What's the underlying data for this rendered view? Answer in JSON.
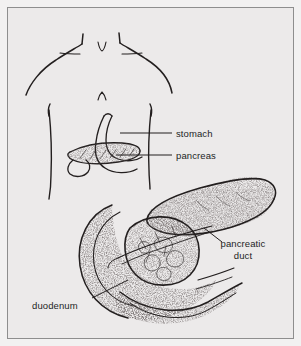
{
  "figure": {
    "kind": "anatomical-line-drawing",
    "style": "black ink line art with stippled shading",
    "background_color": "#eceaea",
    "border_color": "#8e8e8e",
    "ink_color": "#231f1f"
  },
  "labels": {
    "stomach": "stomach",
    "pancreas": "pancreas",
    "pancreatic_duct": "pancreatic duct",
    "duodenum": "duodenum"
  },
  "views": {
    "torso_inset": {
      "description": "upper body outline showing stomach and pancreas in situ",
      "parts": [
        "shoulders",
        "neck notch",
        "clavicles",
        "torso flanks",
        "stomach",
        "pancreas"
      ]
    },
    "detail_view": {
      "description": "enlarged pancreas with duodenal C-loop and pancreatic duct",
      "parts": [
        "pancreas tail",
        "pancreas body",
        "pancreas head",
        "duodenum",
        "pancreatic duct"
      ]
    }
  }
}
